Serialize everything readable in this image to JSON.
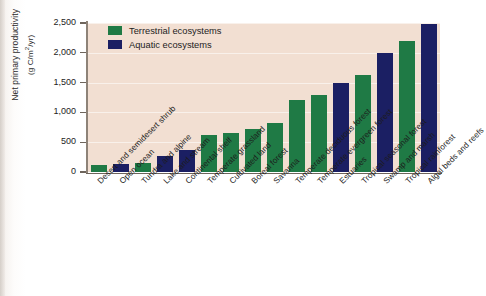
{
  "figure": {
    "y_axis_title_line1": "Net primary productivity",
    "y_axis_title_line2": "(g C/m2/yr)",
    "y_axis_units_pre": "(g C/m",
    "y_axis_units_sup": "2",
    "y_axis_units_post": "/yr)"
  },
  "legend": {
    "position": "top-left-inside",
    "items": [
      {
        "label": "Terrestrial ecosystems",
        "color": "#1f7a45",
        "key": "terrestrial"
      },
      {
        "label": "Aquatic ecosystems",
        "color": "#1b1f63",
        "key": "aquatic"
      }
    ]
  },
  "colors": {
    "terrestrial": "#1f7a45",
    "aquatic": "#1b1f63",
    "plot_background": "#f2dfd2",
    "gridline": "#ffffff",
    "axis": "#6e655c",
    "page_background": "#ffffff"
  },
  "chart_data": {
    "type": "bar",
    "title": "",
    "xlabel": "",
    "ylabel": "Net primary productivity (g C/m2/yr)",
    "ylim": [
      0,
      2500
    ],
    "yticks": [
      0,
      500,
      1000,
      1500,
      2000,
      2500
    ],
    "ytick_labels": [
      "0",
      "500",
      "1,000",
      "1,500",
      "2,000",
      "2,500"
    ],
    "grid": true,
    "legend_position": "upper left",
    "categories": [
      "Desert and semidesert shrub",
      "Open ocean",
      "Tundra and alpine",
      "Lake and stream",
      "Continental shelf",
      "Temperate grassland",
      "Cultivated land",
      "Boreal forest",
      "Savanna",
      "Temperate deciduous forest",
      "Temperate evergreen forest",
      "Estuaries",
      "Tropical seasonal forest",
      "Swamp and marsh",
      "Tropical rainforest",
      "Algal beds and reefs"
    ],
    "values": [
      120,
      140,
      150,
      270,
      370,
      620,
      650,
      720,
      820,
      1200,
      1300,
      1500,
      1620,
      2000,
      2200,
      2480
    ],
    "groups": [
      "terrestrial",
      "aquatic",
      "terrestrial",
      "aquatic",
      "aquatic",
      "terrestrial",
      "terrestrial",
      "terrestrial",
      "terrestrial",
      "terrestrial",
      "terrestrial",
      "aquatic",
      "terrestrial",
      "aquatic",
      "terrestrial",
      "aquatic"
    ],
    "series": [
      {
        "name": "Terrestrial ecosystems",
        "points": [
          {
            "category": "Desert and semidesert shrub",
            "value": 120
          },
          {
            "category": "Tundra and alpine",
            "value": 150
          },
          {
            "category": "Temperate grassland",
            "value": 620
          },
          {
            "category": "Cultivated land",
            "value": 650
          },
          {
            "category": "Boreal forest",
            "value": 720
          },
          {
            "category": "Savanna",
            "value": 820
          },
          {
            "category": "Temperate deciduous forest",
            "value": 1200
          },
          {
            "category": "Temperate evergreen forest",
            "value": 1300
          },
          {
            "category": "Tropical seasonal forest",
            "value": 1620
          },
          {
            "category": "Tropical rainforest",
            "value": 2200
          }
        ]
      },
      {
        "name": "Aquatic ecosystems",
        "points": [
          {
            "category": "Open ocean",
            "value": 140
          },
          {
            "category": "Lake and stream",
            "value": 270
          },
          {
            "category": "Continental shelf",
            "value": 370
          },
          {
            "category": "Estuaries",
            "value": 1500
          },
          {
            "category": "Swamp and marsh",
            "value": 2000
          },
          {
            "category": "Algal beds and reefs",
            "value": 2480
          }
        ]
      }
    ]
  }
}
